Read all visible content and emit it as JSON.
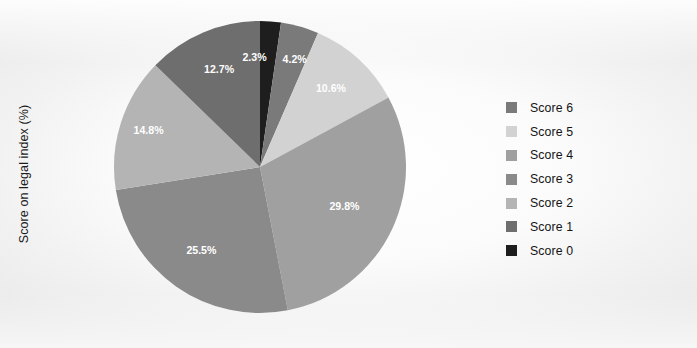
{
  "axis": {
    "ylabel": "Score on legal index (%)"
  },
  "legend": {
    "position": "right",
    "items": [
      {
        "label": "Score 6",
        "color": "#7a7a7a"
      },
      {
        "label": "Score 5",
        "color": "#d2d2d2"
      },
      {
        "label": "Score 4",
        "color": "#a0a0a0"
      },
      {
        "label": "Score 3",
        "color": "#8a8a8a"
      },
      {
        "label": "Score 2",
        "color": "#b4b4b4"
      },
      {
        "label": "Score 1",
        "color": "#6e6e6e"
      },
      {
        "label": "Score 0",
        "color": "#1e1e1e"
      }
    ]
  },
  "chart_data": {
    "type": "pie",
    "title": "",
    "xlabel": "",
    "ylabel": "Score on legal index (%)",
    "legend_position": "right",
    "grid": false,
    "start_angle_deg": 0,
    "direction": "clockwise",
    "categories": [
      "Score 0",
      "Score 6",
      "Score 5",
      "Score 4",
      "Score 3",
      "Score 2",
      "Score 1"
    ],
    "values": [
      2.3,
      4.2,
      10.6,
      29.8,
      25.5,
      14.8,
      12.7
    ],
    "labels": [
      "2.3%",
      "4.2%",
      "10.6%",
      "29.8%",
      "25.5%",
      "14.8%",
      "12.7%"
    ],
    "colors": [
      "#1e1e1e",
      "#7a7a7a",
      "#d2d2d2",
      "#a0a0a0",
      "#8a8a8a",
      "#b4b4b4",
      "#6e6e6e"
    ],
    "slices": [
      {
        "name": "Score 0",
        "value": 2.3,
        "label": "2.3%",
        "color": "#1e1e1e"
      },
      {
        "name": "Score 6",
        "value": 4.2,
        "label": "4.2%",
        "color": "#7a7a7a"
      },
      {
        "name": "Score 5",
        "value": 10.6,
        "label": "10.6%",
        "color": "#d2d2d2"
      },
      {
        "name": "Score 4",
        "value": 29.8,
        "label": "29.8%",
        "color": "#a0a0a0"
      },
      {
        "name": "Score 3",
        "value": 25.5,
        "label": "25.5%",
        "color": "#8a8a8a"
      },
      {
        "name": "Score 2",
        "value": 14.8,
        "label": "14.8%",
        "color": "#b4b4b4"
      },
      {
        "name": "Score 1",
        "value": 12.7,
        "label": "12.7%",
        "color": "#6e6e6e"
      }
    ],
    "total": 99.9
  }
}
